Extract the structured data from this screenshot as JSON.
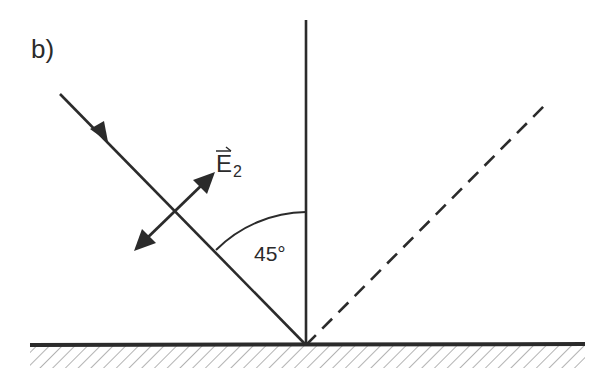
{
  "figure": {
    "panel_label": "b)",
    "field_label": {
      "symbol": "E",
      "subscript": "2",
      "vector_arrow": true
    },
    "angle_label": "45°",
    "colors": {
      "ink": "#2b2b2b",
      "background": "#ffffff"
    },
    "elements": {
      "incident_ray": "solid line with arrowhead toward surface",
      "normal": "vertical solid line",
      "reflected_ray": "dashed line",
      "polarization_vector": "double-headed arrow perpendicular to incident ray",
      "surface": "thick horizontal line with hatching below"
    }
  }
}
